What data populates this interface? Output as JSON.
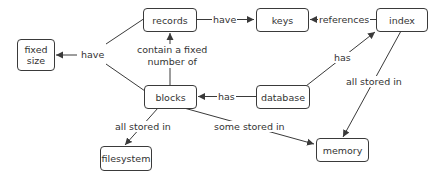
{
  "nodes": {
    "fixed_size": "fixed\nsize",
    "fixed_size_line1": "fixed",
    "fixed_size_line2": "size",
    "records": "records",
    "keys": "keys",
    "index": "index",
    "blocks": "blocks",
    "database": "database",
    "filesystem": "filesystem",
    "memory": "memory"
  },
  "edges": {
    "records_have_keys": "have",
    "index_references_keys": "references",
    "blocks_have_fixed_size": "have",
    "blocks_contain_records_line1": "contain a fixed",
    "blocks_contain_records_line2": "number of",
    "database_has_blocks": "has",
    "database_has_index": "has",
    "index_stored_memory": "all stored in",
    "blocks_stored_filesystem": "all stored in",
    "blocks_some_stored_memory": "some stored in"
  },
  "colors": {
    "stroke": "#3a3a3a",
    "text": "#333333",
    "background": "#ffffff"
  }
}
